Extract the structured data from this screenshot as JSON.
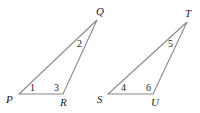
{
  "diagram": {
    "stroke_color": "#8a8a8a",
    "text_color": "#1a1a1a",
    "triangles": [
      {
        "name": "PQR",
        "vertices": [
          {
            "label": "P",
            "x": 19,
            "y": 94,
            "lx": 6,
            "ly": 103
          },
          {
            "label": "R",
            "x": 63,
            "y": 94,
            "lx": 60,
            "ly": 106
          },
          {
            "label": "Q",
            "x": 97,
            "y": 20,
            "lx": 96,
            "ly": 15
          }
        ],
        "angles": [
          {
            "label": "1",
            "x": 30,
            "y": 91
          },
          {
            "label": "3",
            "x": 54,
            "y": 91
          },
          {
            "label": "2",
            "x": 77,
            "y": 47
          }
        ]
      },
      {
        "name": "STU",
        "vertices": [
          {
            "label": "S",
            "x": 108,
            "y": 94,
            "lx": 97,
            "ly": 103
          },
          {
            "label": "U",
            "x": 153,
            "y": 94,
            "lx": 151,
            "ly": 106
          },
          {
            "label": "T",
            "x": 187,
            "y": 22,
            "lx": 185,
            "ly": 17
          }
        ],
        "angles": [
          {
            "label": "4",
            "x": 121,
            "y": 91
          },
          {
            "label": "6",
            "x": 146,
            "y": 91
          },
          {
            "label": "5",
            "x": 168,
            "y": 47
          }
        ]
      }
    ]
  }
}
